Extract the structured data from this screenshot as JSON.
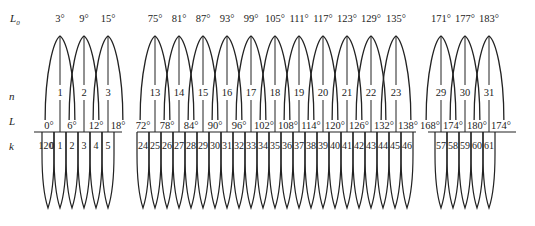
{
  "axis_labels": {
    "L0": "L",
    "L0_sub": "0",
    "n": "n",
    "L": "L",
    "k": "k"
  },
  "layout": {
    "topY": 26,
    "nY": 96,
    "lineY": 132,
    "kY": 146,
    "bottomY": 208,
    "arcStep": 24
  },
  "groups": [
    {
      "name": "left",
      "tops": [
        {
          "x": 60,
          "L0": "3°",
          "n": "1"
        },
        {
          "x": 84,
          "L0": "9°",
          "n": "2"
        },
        {
          "x": 108,
          "L0": "15°",
          "n": "3"
        }
      ],
      "L_labels": [
        {
          "x": 49,
          "text": "0°"
        },
        {
          "x": 72,
          "text": "6°"
        },
        {
          "x": 96,
          "text": "12°"
        },
        {
          "x": 118,
          "text": "18°"
        }
      ],
      "baseline": [
        34,
        122
      ],
      "k_cells": [
        {
          "x": 46,
          "text": "120"
        },
        {
          "x": 52,
          "text": "0"
        },
        {
          "x": 60,
          "text": "1"
        },
        {
          "x": 72,
          "text": "2"
        },
        {
          "x": 84,
          "text": "3"
        },
        {
          "x": 96,
          "text": "4"
        },
        {
          "x": 108,
          "text": "5"
        }
      ],
      "v_tips": [
        48,
        60,
        72,
        84,
        96,
        108
      ]
    },
    {
      "name": "middle",
      "tops": [
        {
          "x": 155,
          "L0": "75°",
          "n": "13"
        },
        {
          "x": 179,
          "L0": "81°",
          "n": "14"
        },
        {
          "x": 203,
          "L0": "87°",
          "n": "15"
        },
        {
          "x": 227,
          "L0": "93°",
          "n": "16"
        },
        {
          "x": 251,
          "L0": "99°",
          "n": "17"
        },
        {
          "x": 275,
          "L0": "105°",
          "n": "18"
        },
        {
          "x": 299,
          "L0": "111°",
          "n": "19"
        },
        {
          "x": 323,
          "L0": "117°",
          "n": "20"
        },
        {
          "x": 347,
          "L0": "123°",
          "n": "21"
        },
        {
          "x": 371,
          "L0": "129°",
          "n": "22"
        },
        {
          "x": 396,
          "L0": "135°",
          "n": "23"
        }
      ],
      "L_labels": [
        {
          "x": 143,
          "text": "72°"
        },
        {
          "x": 167,
          "text": "78°"
        },
        {
          "x": 191,
          "text": "84°"
        },
        {
          "x": 215,
          "text": "90°"
        },
        {
          "x": 239,
          "text": "96°"
        },
        {
          "x": 264,
          "text": "102°"
        },
        {
          "x": 288,
          "text": "108°"
        },
        {
          "x": 311,
          "text": "114°"
        },
        {
          "x": 335,
          "text": "120°"
        },
        {
          "x": 359,
          "text": "126°"
        },
        {
          "x": 384,
          "text": "132°"
        },
        {
          "x": 408,
          "text": "138°"
        }
      ],
      "baseline": [
        137,
        416
      ],
      "k_cells": [
        {
          "x": 143,
          "text": "24"
        },
        {
          "x": 155,
          "text": "25"
        },
        {
          "x": 167,
          "text": "26"
        },
        {
          "x": 179,
          "text": "27"
        },
        {
          "x": 191,
          "text": "28"
        },
        {
          "x": 203,
          "text": "29"
        },
        {
          "x": 215,
          "text": "30"
        },
        {
          "x": 227,
          "text": "31"
        },
        {
          "x": 239,
          "text": "32"
        },
        {
          "x": 251,
          "text": "33"
        },
        {
          "x": 263,
          "text": "34"
        },
        {
          "x": 275,
          "text": "35"
        },
        {
          "x": 287,
          "text": "36"
        },
        {
          "x": 299,
          "text": "37"
        },
        {
          "x": 311,
          "text": "38"
        },
        {
          "x": 323,
          "text": "39"
        },
        {
          "x": 335,
          "text": "40"
        },
        {
          "x": 347,
          "text": "41"
        },
        {
          "x": 359,
          "text": "42"
        },
        {
          "x": 371,
          "text": "43"
        },
        {
          "x": 383,
          "text": "44"
        },
        {
          "x": 395,
          "text": "45"
        },
        {
          "x": 407,
          "text": "46"
        }
      ],
      "v_tips": [
        143,
        155,
        167,
        179,
        191,
        203,
        215,
        227,
        239,
        251,
        263,
        275,
        287,
        299,
        311,
        323,
        335,
        347,
        359,
        371,
        383,
        395,
        407
      ]
    },
    {
      "name": "right",
      "tops": [
        {
          "x": 441,
          "L0": "171°",
          "n": "29"
        },
        {
          "x": 465,
          "L0": "177°",
          "n": "30"
        },
        {
          "x": 489,
          "L0": "183°",
          "n": "31"
        }
      ],
      "L_labels": [
        {
          "x": 430,
          "text": "168°"
        },
        {
          "x": 453,
          "text": "174°"
        },
        {
          "x": 477,
          "text": "180°"
        },
        {
          "x": 501,
          "text": "174°"
        }
      ],
      "baseline": [
        428,
        516
      ],
      "k_cells": [
        {
          "x": 441,
          "text": "57"
        },
        {
          "x": 453,
          "text": "58"
        },
        {
          "x": 465,
          "text": "59"
        },
        {
          "x": 477,
          "text": "60"
        },
        {
          "x": 489,
          "text": "61"
        }
      ],
      "v_tips": [
        441,
        453,
        465,
        477,
        489
      ]
    }
  ]
}
